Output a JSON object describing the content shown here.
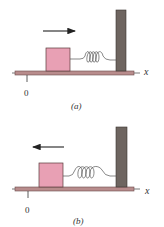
{
  "colors": {
    "block": "#e8a0b4",
    "block_edge": "#5a3a3a",
    "floor": "#b88c8c",
    "floor_edge": "#6a4a4a",
    "wall": "#6e6560",
    "spring": "#555555",
    "arrow": "#222222"
  },
  "panels": [
    {
      "caption": "(a)",
      "origin_label": "0",
      "axis_label": "x",
      "arrow_direction": "right"
    },
    {
      "caption": "(b)",
      "origin_label": "0",
      "axis_label": "x",
      "arrow_direction": "left"
    }
  ]
}
